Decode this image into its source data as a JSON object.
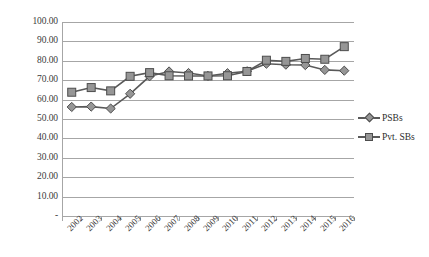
{
  "chart_data": {
    "type": "line",
    "title": "",
    "xlabel": "",
    "ylabel": "",
    "ylim": [
      0,
      100
    ],
    "ytick_step": 10,
    "grid": true,
    "legend_position": "right",
    "categories": [
      "2002",
      "2003",
      "2004",
      "2005",
      "2006",
      "2007",
      "2008",
      "2009",
      "2010",
      "2011",
      "2012",
      "2013",
      "2014",
      "2015",
      "2016"
    ],
    "ytick_labels": [
      "100.00",
      "90.00",
      "80.00",
      "70.00",
      "60.00",
      "50.00",
      "40.00",
      "30.00",
      "20.00",
      "10.00",
      "-"
    ],
    "ytick_values": [
      100,
      90,
      80,
      70,
      60,
      50,
      40,
      30,
      20,
      10,
      0
    ],
    "series": [
      {
        "name": "PSBs",
        "marker": "diamond",
        "color": "#595959",
        "values": [
          56.2,
          56.4,
          55.4,
          63.0,
          72.0,
          74.5,
          73.7,
          72.2,
          73.6,
          74.6,
          78.5,
          78.0,
          77.8,
          75.3,
          74.9
        ]
      },
      {
        "name": "Pvt. SBs",
        "marker": "square",
        "color": "#595959",
        "values": [
          63.8,
          66.2,
          64.5,
          72.0,
          73.9,
          72.3,
          72.2,
          72.2,
          72.3,
          74.5,
          80.3,
          79.7,
          81.2,
          80.8,
          87.3
        ]
      }
    ]
  },
  "legend": {
    "items": [
      {
        "label": "PSBs"
      },
      {
        "label": "Pvt. SBs"
      }
    ]
  },
  "colors": {
    "grid": "#a6a6a6",
    "axis": "#a6a6a6",
    "line": "#595959",
    "marker_fill": "#969696",
    "marker_stroke": "#4d4d4d",
    "text": "#3b3b3b",
    "background": "#ffffff"
  }
}
